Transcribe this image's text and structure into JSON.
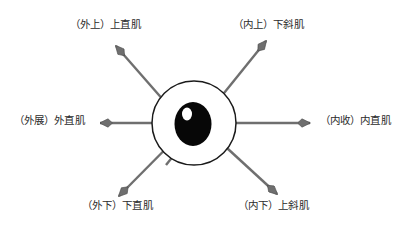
{
  "diagram": {
    "type": "anatomical-schematic",
    "eye": {
      "sclera_color": "#ffffff",
      "outline_color": "#1a1a1a",
      "pupil_color": "#050505",
      "highlight_color": "#ffffff",
      "center_x": 194,
      "center_y": 123,
      "radius": 42
    },
    "arrow_color": "#6b6b6b",
    "arrow_outline_color": "#4a4a4a",
    "arrows": [
      {
        "id": "upper-lateral",
        "direction": "up-left",
        "angle_deg": 145
      },
      {
        "id": "upper-medial",
        "direction": "up-right",
        "angle_deg": 56
      },
      {
        "id": "lateral",
        "direction": "left",
        "angle_deg": 180
      },
      {
        "id": "medial",
        "direction": "right",
        "angle_deg": 0
      },
      {
        "id": "lower-lateral",
        "direction": "down-left",
        "angle_deg": 215
      },
      {
        "id": "lower-medial",
        "direction": "down-right",
        "angle_deg": 325
      }
    ]
  },
  "labels": {
    "top_left": "（外上）上直肌",
    "top_right": "（内上）下斜肌",
    "left": "（外展）外直肌",
    "right": "（内收）内直肌",
    "bottom_left": "（外下）下直肌",
    "bottom_right": "（内下）上斜肌"
  }
}
